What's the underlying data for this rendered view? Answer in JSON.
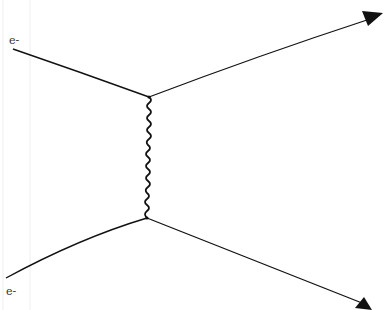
{
  "diagram": {
    "type": "feynman-diagram",
    "colors": {
      "line": "#111111",
      "label": "#333333",
      "background": "#ffffff"
    },
    "labels": {
      "incoming_top": "e-",
      "incoming_bottom": "e-"
    },
    "vertices": [
      {
        "id": "top",
        "x": 149,
        "y": 97
      },
      {
        "id": "bottom",
        "x": 147,
        "y": 218
      }
    ],
    "fermion_lines": [
      {
        "id": "incoming-top",
        "from": [
          13,
          49
        ],
        "to": [
          149,
          97
        ],
        "arrow": false
      },
      {
        "id": "outgoing-top",
        "from": [
          149,
          97
        ],
        "to": [
          383,
          14
        ],
        "arrow": true
      },
      {
        "id": "incoming-bottom",
        "from": [
          6,
          278
        ],
        "to": [
          147,
          218
        ],
        "arrow": false
      },
      {
        "id": "outgoing-bottom",
        "from": [
          147,
          218
        ],
        "to": [
          372,
          308
        ],
        "arrow": true
      }
    ],
    "propagator": {
      "id": "photon",
      "kind": "wavy",
      "from": "top",
      "to": "bottom"
    }
  }
}
